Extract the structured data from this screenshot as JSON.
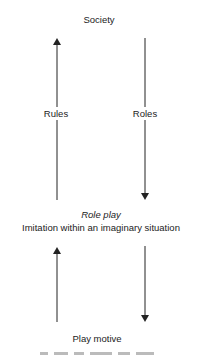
{
  "nodes": {
    "top": "Society",
    "middle_title": "Role play",
    "middle_subtitle": "Imitation within an imaginary situation",
    "bottom": "Play motive"
  },
  "edges": [
    {
      "from": "Role play",
      "to": "Society",
      "label": "Rules",
      "direction": "up",
      "side": "left"
    },
    {
      "from": "Society",
      "to": "Role play",
      "label": "Roles",
      "direction": "down",
      "side": "right"
    },
    {
      "from": "Play motive",
      "to": "Role play",
      "label": "",
      "direction": "up",
      "side": "left"
    },
    {
      "from": "Role play",
      "to": "Play motive",
      "label": "",
      "direction": "down",
      "side": "right"
    }
  ],
  "colors": {
    "line": "#222222",
    "text": "#222222",
    "background": "#ffffff"
  }
}
